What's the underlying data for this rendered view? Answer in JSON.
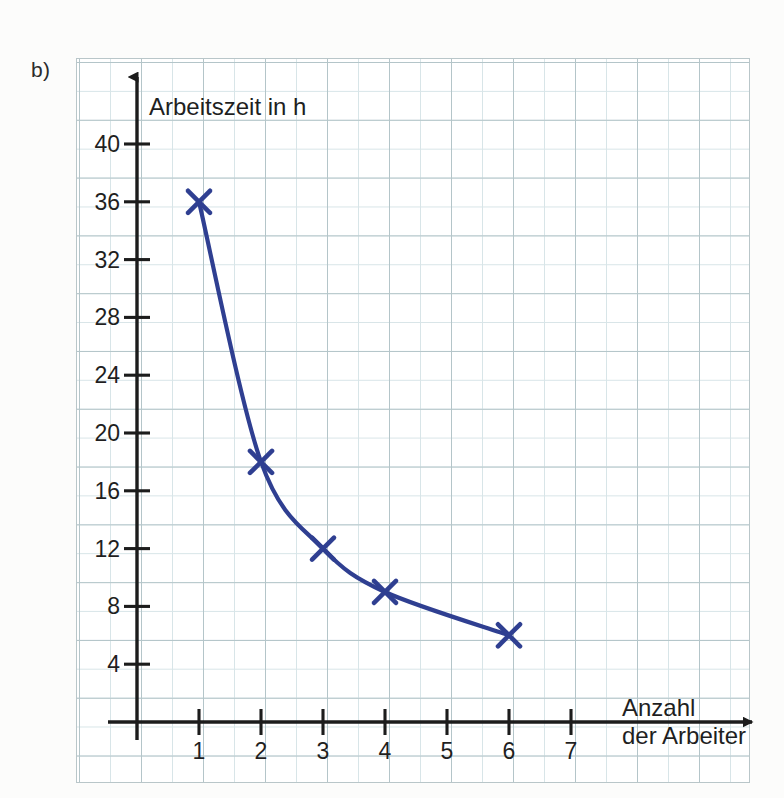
{
  "exercise": {
    "label": "b)"
  },
  "chart_data": {
    "type": "line",
    "title": "",
    "subtitle": "",
    "xlabel_line1": "Anzahl",
    "xlabel_line2": "der Arbeiter",
    "ylabel": "Arbeitszeit in h",
    "xlabel": "Anzahl der Arbeiter",
    "x": [
      1,
      2,
      3,
      4,
      6
    ],
    "values": [
      36,
      18,
      12,
      9,
      6
    ],
    "series": [
      {
        "name": "Arbeitszeit",
        "x": [
          1,
          2,
          3,
          4,
          6
        ],
        "values": [
          36,
          18,
          12,
          9,
          6
        ],
        "color": "#2f3f91",
        "marker": "x",
        "relation": "Arbeitszeit = 36 / Anzahl der Arbeiter"
      }
    ],
    "xticks": [
      1,
      2,
      3,
      4,
      5,
      6,
      7
    ],
    "xtick_labels": [
      "1",
      "2",
      "3",
      "4",
      "5",
      "6",
      "7"
    ],
    "yticks": [
      4,
      8,
      12,
      16,
      20,
      24,
      28,
      32,
      36,
      40
    ],
    "ytick_labels": [
      "4",
      "8",
      "12",
      "16",
      "20",
      "24",
      "28",
      "32",
      "36",
      "40"
    ],
    "xlim": [
      0,
      7.8
    ],
    "ylim": [
      0,
      42
    ],
    "grid": true,
    "legend": false,
    "legend_position": "none"
  },
  "colors": {
    "curve": "#2f3f91",
    "axis": "#1c1c1c",
    "grid_major": "#b4c5c9",
    "grid_minor": "#d8e5e8",
    "paper": "#ffffff"
  }
}
